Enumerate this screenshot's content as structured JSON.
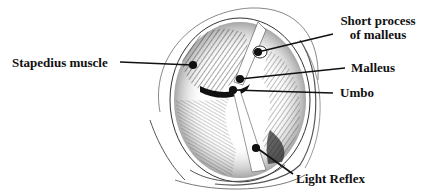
{
  "diagram": {
    "labels": {
      "stapedius": "Stapedius muscle",
      "short_process_line1": "Short process",
      "short_process_line2": "of malleus",
      "malleus": "Malleus",
      "umbo": "Umbo",
      "light_reflex": "Light Reflex"
    },
    "colors": {
      "ink": "#111111",
      "background": "#ffffff"
    }
  }
}
